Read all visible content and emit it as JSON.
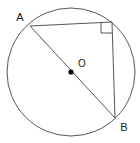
{
  "figure": {
    "background_color": "#ffffff",
    "stroke_color": "#555555",
    "label_color": "#1a1a1a",
    "point_fill_color": "#000000",
    "width": 140,
    "height": 143
  },
  "circle": {
    "name": "circle",
    "center_x": 71,
    "center_y": 72,
    "radius": 64,
    "stroke_width": 1
  },
  "center_point": {
    "name": "center-point-O",
    "x": 71,
    "y": 72,
    "radius": 2.6
  },
  "labels": {
    "point_a": "A",
    "point_b": "B",
    "center": "O"
  },
  "label_positions": {
    "point_a": {
      "x": 20,
      "y": 21
    },
    "point_b": {
      "x": 124,
      "y": 131
    },
    "center": {
      "x": 82,
      "y": 67
    }
  },
  "points": {
    "a": {
      "x": 30,
      "y": 26
    },
    "b": {
      "x": 115,
      "y": 118
    },
    "c": {
      "x": 112,
      "y": 22
    }
  },
  "segments": [
    {
      "name": "diameter-ab",
      "x1": 30,
      "y1": 26,
      "x2": 115,
      "y2": 118
    },
    {
      "name": "chord-ac",
      "x1": 30,
      "y1": 26,
      "x2": 112,
      "y2": 22
    },
    {
      "name": "chord-cb",
      "x1": 112,
      "y1": 22,
      "x2": 115,
      "y2": 118
    }
  ],
  "right_angle_marker": {
    "name": "right-angle-marker",
    "points": "101,22 101,33 112,33"
  }
}
